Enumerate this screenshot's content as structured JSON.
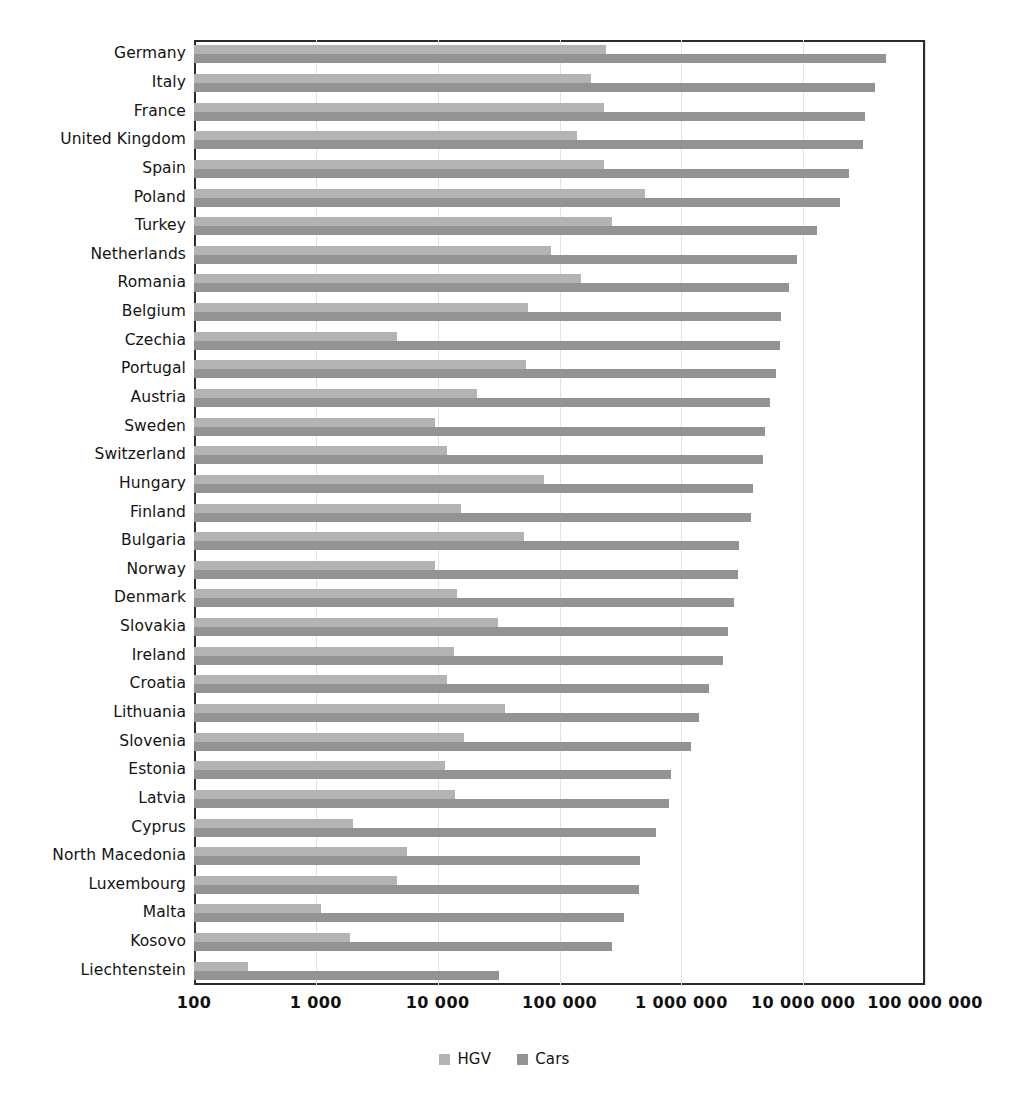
{
  "chart_data": {
    "type": "bar",
    "orientation": "horizontal",
    "title": "",
    "subtitle": "",
    "xlabel": "",
    "ylabel": "",
    "xscale": "log",
    "xlim": [
      100,
      100000000
    ],
    "grid": true,
    "legend_position": "bottom",
    "xticks": [
      "100",
      "1 000",
      "10 000",
      "100 000",
      "1 000 000",
      "10 000 000",
      "100 000 000"
    ],
    "xtick_values": [
      100,
      1000,
      10000,
      100000,
      1000000,
      10000000,
      100000000
    ],
    "categories": [
      "Germany",
      "Italy",
      "France",
      "United Kingdom",
      "Spain",
      "Poland",
      "Turkey",
      "Netherlands",
      "Romania",
      "Belgium",
      "Czechia",
      "Portugal",
      "Austria",
      "Sweden",
      "Switzerland",
      "Hungary",
      "Finland",
      "Bulgaria",
      "Norway",
      "Denmark",
      "Slovakia",
      "Ireland",
      "Croatia",
      "Lithuania",
      "Slovenia",
      "Estonia",
      "Latvia",
      "Cyprus",
      "North Macedonia",
      "Luxembourg",
      "Malta",
      "Kosovo",
      "Liechtenstein"
    ],
    "series": [
      {
        "name": "HGV",
        "color": "#b3b3b3",
        "values": [
          240000,
          180000,
          230000,
          140000,
          230000,
          500000,
          270000,
          85000,
          150000,
          55000,
          4600,
          53000,
          21000,
          9500,
          12000,
          74000,
          15500,
          51000,
          9500,
          14500,
          31000,
          13500,
          12000,
          36000,
          16500,
          11500,
          14000,
          2000,
          5600,
          4600,
          1100,
          1900,
          280
        ]
      },
      {
        "name": "Cars",
        "color": "#939393",
        "values": [
          48000000,
          39000000,
          32000000,
          31000000,
          24000000,
          20000000,
          13000000,
          8900000,
          7700000,
          6600000,
          6400000,
          6000000,
          5300000,
          4900000,
          4700000,
          3900000,
          3700000,
          3000000,
          2900000,
          2700000,
          2400000,
          2200000,
          1700000,
          1400000,
          1200000,
          830000,
          790000,
          620000,
          460000,
          450000,
          340000,
          270000,
          32000
        ]
      }
    ]
  },
  "legend": {
    "items": [
      {
        "label": "HGV",
        "color": "#b3b3b3"
      },
      {
        "label": "Cars",
        "color": "#939393"
      }
    ]
  }
}
